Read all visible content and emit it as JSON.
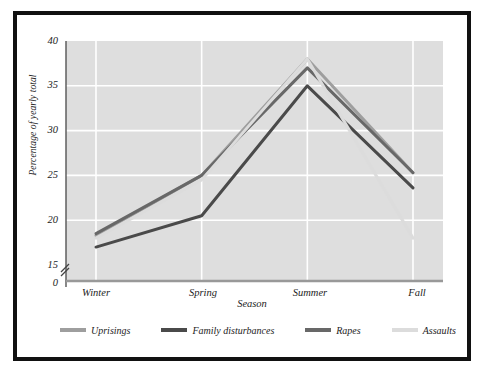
{
  "chart_data": {
    "type": "line",
    "title": "",
    "xlabel": "Season",
    "ylabel": "Percentage of yearly total",
    "categories": [
      "Winter",
      "Spring",
      "Summer",
      "Fall"
    ],
    "ylim": [
      15,
      40
    ],
    "yticks": [
      "0",
      "15",
      "20",
      "25",
      "30",
      "35",
      "40"
    ],
    "axis_break": true,
    "axis_break_note": "y-axis broken between 0 and 15",
    "grid": true,
    "legend_position": "bottom",
    "series": [
      {
        "name": "Uprisings",
        "color": "#9e9e9e",
        "values": [
          18.3,
          25.0,
          38.0,
          25.3
        ]
      },
      {
        "name": "Family disturbances",
        "color": "#4a4a4a",
        "values": [
          17.0,
          20.5,
          35.0,
          23.6
        ]
      },
      {
        "name": "Rapes",
        "color": "#686868",
        "values": [
          18.5,
          25.0,
          37.0,
          25.3
        ]
      },
      {
        "name": "Assaults",
        "color": "#dcdcdc",
        "values": [
          18.0,
          24.5,
          38.0,
          18.0
        ]
      }
    ]
  },
  "plot": {
    "background_color": "#dedede",
    "gridline_color": "#ffffff",
    "frame_color": "#111111"
  }
}
